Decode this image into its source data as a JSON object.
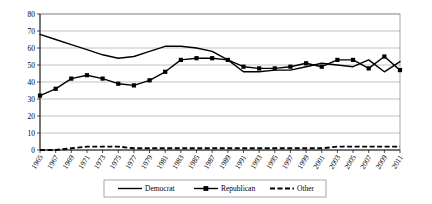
{
  "chart_data": {
    "type": "line",
    "title": "",
    "xlabel": "",
    "ylabel": "",
    "ylim": [
      0,
      80
    ],
    "ytick_step": 10,
    "grid": true,
    "legend_position": "bottom",
    "categories": [
      "1965",
      "1967",
      "1969",
      "1971",
      "1973",
      "1975",
      "1977",
      "1979",
      "1981",
      "1983",
      "1985",
      "1987",
      "1989",
      "1991",
      "1993",
      "1995",
      "1997",
      "1999",
      "2001",
      "2003",
      "2005",
      "2007",
      "2009",
      "2011"
    ],
    "yticks": [
      "0",
      "10",
      "20",
      "30",
      "40",
      "50",
      "60",
      "70",
      "80"
    ],
    "series": [
      {
        "name": "Democrat",
        "marker": "none",
        "line": "solid",
        "values": [
          68,
          65,
          62,
          59,
          56,
          54,
          55,
          58,
          61,
          61,
          60,
          58,
          53,
          46,
          46,
          47,
          47,
          49,
          51,
          50,
          49,
          53,
          46,
          52
        ]
      },
      {
        "name": "Republican",
        "marker": "square",
        "line": "solid",
        "values": [
          32,
          36,
          42,
          44,
          42,
          39,
          38,
          41,
          46,
          53,
          54,
          54,
          53,
          49,
          48,
          48,
          49,
          51,
          49,
          53,
          53,
          48,
          55,
          47
        ]
      },
      {
        "name": "Other",
        "marker": "none",
        "line": "dashed",
        "values": [
          0,
          0,
          1,
          2,
          2,
          2,
          1,
          1,
          1,
          1,
          1,
          1,
          1,
          1,
          1,
          1,
          1,
          1,
          1,
          2,
          2,
          2,
          2,
          2
        ]
      }
    ]
  },
  "legend": {
    "items": [
      {
        "label": "Democrat"
      },
      {
        "label": "Republican"
      },
      {
        "label": "Other"
      }
    ]
  },
  "colors": {
    "series": "#000000",
    "grid": "#a6a6a6",
    "frame": "#808080",
    "background": "#ffffff"
  }
}
